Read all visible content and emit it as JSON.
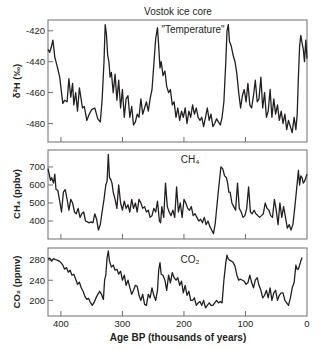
{
  "figure": {
    "title": "Vostok ice core",
    "xlabel": "Age BP (thousands of years)",
    "x_ticks": [
      "400",
      "300",
      "200",
      "100",
      "0"
    ]
  },
  "panels": [
    {
      "id": "temperature",
      "label": "\"Temperature\"",
      "ylabel": "δ²H (‰)",
      "y_ticks": [
        "-420",
        "-440",
        "-460",
        "-480"
      ]
    },
    {
      "id": "ch4",
      "label": "CH₄",
      "ylabel": "CH₄ (ppbv)",
      "y_ticks": [
        "700",
        "600",
        "500",
        "400"
      ]
    },
    {
      "id": "co2",
      "label": "CO₂",
      "ylabel": "CO₂ (ppmv)",
      "y_ticks": [
        "280",
        "240",
        "200"
      ]
    }
  ],
  "chart_data": [
    {
      "type": "line",
      "title": "\"Temperature\"",
      "suptitle": "Vostok ice core",
      "xlabel": "Age BP (thousands of years)",
      "ylabel": "δ²H (‰)",
      "xlim": [
        421,
        0
      ],
      "ylim": [
        -492,
        -413
      ],
      "x_ticks": [
        400,
        300,
        200,
        100,
        0
      ],
      "y_ticks": [
        -420,
        -440,
        -460,
        -480
      ],
      "grid": false,
      "x": [
        421,
        418,
        416,
        413,
        410,
        406,
        402,
        397,
        394,
        390,
        387,
        384,
        381,
        379,
        376,
        373,
        370,
        368,
        365,
        362,
        358,
        354,
        350,
        345,
        340,
        336,
        333,
        330,
        328,
        326,
        324,
        322,
        320,
        318,
        315,
        312,
        309,
        306,
        303,
        300,
        297,
        294,
        291,
        288,
        285,
        282,
        279,
        276,
        273,
        270,
        267,
        264,
        261,
        258,
        255,
        252,
        249,
        246,
        243,
        241,
        239,
        237,
        234,
        231,
        228,
        225,
        222,
        219,
        216,
        213,
        210,
        207,
        204,
        201,
        198,
        195,
        192,
        189,
        186,
        183,
        180,
        177,
        174,
        171,
        168,
        165,
        162,
        159,
        156,
        153,
        150,
        147,
        144,
        141,
        138,
        135,
        132,
        130,
        128,
        126,
        123,
        120,
        117,
        114,
        111,
        108,
        105,
        102,
        99,
        96,
        93,
        90,
        87,
        84,
        81,
        78,
        75,
        72,
        69,
        66,
        63,
        60,
        57,
        54,
        51,
        48,
        45,
        42,
        39,
        36,
        33,
        30,
        27,
        24,
        21,
        18,
        16,
        14,
        12,
        10,
        8,
        6,
        4,
        2,
        0
      ],
      "values": [
        -432,
        -434,
        -431,
        -426,
        -437,
        -443,
        -450,
        -467,
        -465,
        -466,
        -451,
        -463,
        -454,
        -468,
        -460,
        -472,
        -457,
        -462,
        -470,
        -469,
        -478,
        -474,
        -471,
        -470,
        -477,
        -479,
        -465,
        -440,
        -416,
        -422,
        -436,
        -440,
        -450,
        -447,
        -460,
        -448,
        -465,
        -452,
        -470,
        -458,
        -476,
        -464,
        -462,
        -476,
        -469,
        -481,
        -479,
        -474,
        -476,
        -464,
        -474,
        -470,
        -466,
        -472,
        -464,
        -458,
        -442,
        -425,
        -418,
        -430,
        -444,
        -440,
        -449,
        -446,
        -456,
        -460,
        -458,
        -468,
        -466,
        -476,
        -470,
        -478,
        -472,
        -476,
        -470,
        -480,
        -472,
        -476,
        -468,
        -474,
        -470,
        -476,
        -478,
        -476,
        -482,
        -476,
        -470,
        -478,
        -474,
        -482,
        -480,
        -477,
        -479,
        -481,
        -476,
        -466,
        -440,
        -420,
        -416,
        -427,
        -430,
        -436,
        -440,
        -448,
        -460,
        -470,
        -462,
        -458,
        -466,
        -454,
        -468,
        -470,
        -462,
        -452,
        -466,
        -464,
        -450,
        -470,
        -460,
        -476,
        -472,
        -458,
        -476,
        -464,
        -474,
        -468,
        -478,
        -472,
        -480,
        -474,
        -484,
        -478,
        -482,
        -486,
        -476,
        -484,
        -474,
        -450,
        -430,
        -423,
        -428,
        -432,
        -440,
        -426,
        -438,
        -431
      ]
    },
    {
      "type": "line",
      "title": "CH₄",
      "xlabel": "Age BP (thousands of years)",
      "ylabel": "CH₄ (ppbv)",
      "xlim": [
        421,
        0
      ],
      "ylim": [
        300,
        794
      ],
      "x_ticks": [
        400,
        300,
        200,
        100,
        0
      ],
      "y_ticks": [
        700,
        600,
        500,
        400
      ],
      "grid": false,
      "x": [
        421,
        419,
        417,
        415,
        412,
        410,
        408,
        405,
        402,
        399,
        396,
        393,
        390,
        387,
        384,
        381,
        378,
        375,
        372,
        369,
        366,
        363,
        360,
        357,
        354,
        351,
        348,
        345,
        342,
        339,
        336,
        333,
        330,
        327,
        325,
        323,
        321,
        319,
        317,
        315,
        312,
        309,
        306,
        303,
        300,
        297,
        294,
        291,
        288,
        285,
        282,
        279,
        276,
        273,
        270,
        267,
        264,
        261,
        258,
        255,
        252,
        249,
        246,
        243,
        240,
        238,
        236,
        233,
        230,
        227,
        224,
        221,
        218,
        215,
        212,
        209,
        206,
        203,
        200,
        197,
        194,
        191,
        188,
        185,
        182,
        179,
        176,
        173,
        170,
        167,
        164,
        161,
        158,
        155,
        152,
        149,
        146,
        143,
        140,
        137,
        134,
        131,
        129,
        127,
        125,
        122,
        119,
        116,
        113,
        110,
        107,
        104,
        101,
        98,
        95,
        92,
        89,
        86,
        83,
        80,
        77,
        74,
        71,
        68,
        65,
        62,
        59,
        56,
        53,
        50,
        47,
        44,
        41,
        38,
        35,
        32,
        29,
        26,
        23,
        20,
        17,
        14,
        12,
        10,
        8,
        6,
        4,
        2,
        0
      ],
      "values": [
        690,
        660,
        625,
        640,
        610,
        660,
        575,
        570,
        510,
        450,
        560,
        575,
        520,
        460,
        520,
        500,
        450,
        440,
        470,
        420,
        440,
        450,
        400,
        395,
        390,
        395,
        390,
        440,
        410,
        350,
        380,
        450,
        520,
        600,
        620,
        770,
        640,
        630,
        610,
        560,
        520,
        470,
        600,
        500,
        460,
        510,
        470,
        490,
        450,
        520,
        470,
        500,
        450,
        520,
        500,
        470,
        480,
        450,
        460,
        420,
        430,
        470,
        450,
        510,
        400,
        390,
        480,
        420,
        610,
        480,
        450,
        430,
        460,
        420,
        590,
        450,
        500,
        420,
        520,
        500,
        470,
        460,
        480,
        430,
        440,
        420,
        400,
        410,
        390,
        420,
        380,
        400,
        370,
        350,
        330,
        390,
        500,
        600,
        700,
        690,
        650,
        640,
        610,
        560,
        560,
        500,
        480,
        460,
        610,
        470,
        450,
        420,
        430,
        470,
        590,
        450,
        440,
        460,
        440,
        430,
        420,
        430,
        440,
        500,
        470,
        460,
        430,
        420,
        520,
        460,
        380,
        500,
        420,
        480,
        420,
        360,
        380,
        350,
        380,
        470,
        570,
        680,
        600,
        650,
        640,
        610,
        620,
        640,
        660
      ]
    },
    {
      "type": "line",
      "title": "CO₂",
      "xlabel": "Age BP (thousands of years)",
      "ylabel": "CO₂ (ppmv)",
      "xlim": [
        421,
        0
      ],
      "ylim": [
        169,
        304
      ],
      "x_ticks": [
        400,
        300,
        200,
        100,
        0
      ],
      "y_ticks": [
        280,
        240,
        200
      ],
      "grid": false,
      "x": [
        421,
        418,
        415,
        412,
        409,
        406,
        403,
        400,
        397,
        394,
        391,
        388,
        385,
        382,
        379,
        376,
        373,
        370,
        367,
        364,
        361,
        358,
        355,
        352,
        349,
        346,
        343,
        340,
        337,
        334,
        331,
        329,
        327,
        325,
        323,
        321,
        318,
        315,
        312,
        309,
        306,
        303,
        300,
        297,
        294,
        291,
        288,
        285,
        282,
        279,
        276,
        273,
        270,
        267,
        264,
        261,
        258,
        255,
        252,
        249,
        246,
        243,
        241,
        239,
        237,
        234,
        231,
        228,
        225,
        222,
        219,
        216,
        213,
        210,
        207,
        204,
        201,
        198,
        195,
        192,
        189,
        186,
        183,
        180,
        177,
        174,
        171,
        168,
        165,
        162,
        159,
        156,
        153,
        150,
        147,
        144,
        141,
        138,
        135,
        132,
        130,
        128,
        126,
        123,
        120,
        117,
        114,
        111,
        108,
        105,
        102,
        99,
        96,
        93,
        90,
        87,
        84,
        81,
        78,
        75,
        72,
        69,
        66,
        63,
        60,
        57,
        54,
        51,
        48,
        45,
        42,
        39,
        36,
        33,
        30,
        27,
        24,
        21,
        18,
        16,
        14,
        12,
        10,
        8,
        6,
        4,
        2,
        0
      ],
      "values": [
        282,
        284,
        278,
        283,
        281,
        280,
        278,
        275,
        270,
        262,
        265,
        256,
        260,
        250,
        252,
        242,
        232,
        236,
        225,
        218,
        208,
        202,
        204,
        196,
        190,
        196,
        205,
        212,
        218,
        212,
        202,
        240,
        250,
        285,
        298,
        278,
        266,
        270,
        260,
        262,
        252,
        258,
        240,
        250,
        230,
        240,
        226,
        212,
        220,
        230,
        228,
        210,
        200,
        212,
        192,
        190,
        212,
        205,
        225,
        210,
        200,
        220,
        260,
        275,
        252,
        250,
        240,
        220,
        250,
        235,
        255,
        245,
        240,
        245,
        230,
        238,
        215,
        230,
        210,
        218,
        200,
        200,
        205,
        190,
        195,
        198,
        190,
        200,
        185,
        190,
        195,
        190,
        190,
        195,
        200,
        195,
        198,
        195,
        240,
        275,
        290,
        282,
        280,
        278,
        275,
        268,
        250,
        240,
        242,
        240,
        238,
        232,
        235,
        250,
        236,
        225,
        240,
        245,
        230,
        220,
        205,
        210,
        220,
        205,
        225,
        200,
        215,
        220,
        200,
        210,
        215,
        215,
        200,
        195,
        190,
        205,
        225,
        235,
        270,
        262,
        262,
        270,
        278,
        285
      ]
    }
  ]
}
